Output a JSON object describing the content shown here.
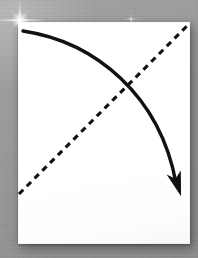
{
  "scene": {
    "width": 198,
    "height": 258,
    "background_color": "#999999",
    "description": "White sheet of paper on a gray surface with a hand-drawn curved arrow and a dashed diagonal line"
  },
  "paper": {
    "label": "paper-sheet",
    "fill_color": "#ffffff",
    "left": 18,
    "top": 22,
    "width": 172,
    "height": 222
  },
  "annotations": {
    "curved_arrow": {
      "label": "curved-arrow",
      "stroke_color": "#111111",
      "stroke_width": 3.4,
      "style": "solid",
      "start": [
        23,
        31
      ],
      "end": [
        180,
        193
      ],
      "control_points": [
        [
          96,
          42
        ],
        [
          160,
          96
        ]
      ],
      "direction": "down-right",
      "has_arrowhead": true,
      "arrowhead_end": "end"
    },
    "dashed_line": {
      "label": "dashed-diagonal-line",
      "stroke_color": "#111111",
      "stroke_width": 3.1,
      "style": "dashed",
      "dash_length": 6,
      "gap_length": 5,
      "start": [
        19,
        194
      ],
      "end": [
        188,
        25
      ],
      "direction": "up-right",
      "has_arrowhead": false
    },
    "intersection_point": [
      125,
      88
    ]
  },
  "highlights": [
    {
      "label": "lens-flare-sparkle-large",
      "x": 20,
      "y": 20,
      "size": 52,
      "color": "#ffffff"
    },
    {
      "label": "lens-flare-sparkle-small",
      "x": 131,
      "y": 19,
      "size": 18,
      "color": "#ffffff"
    }
  ]
}
